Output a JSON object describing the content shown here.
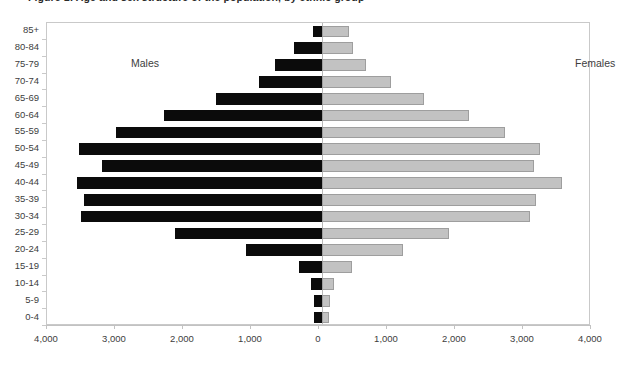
{
  "chart_data": {
    "type": "bar",
    "subtype": "population-pyramid",
    "title": "Figure 1: Age and sex structure of the population, by ethnic group",
    "xlabel": "",
    "ylabel": "",
    "xlim": [
      -4000,
      4000
    ],
    "xticks": [
      "4,000",
      "3,000",
      "2,000",
      "1,000",
      "0",
      "1,000",
      "2,000",
      "3,000",
      "4,000"
    ],
    "xtick_values": [
      -4000,
      -3000,
      -2000,
      -1000,
      0,
      1000,
      2000,
      3000,
      4000
    ],
    "grid": false,
    "legend_position": "in-plot",
    "categories": [
      "85+",
      "80-84",
      "75-79",
      "70-74",
      "65-69",
      "60-64",
      "55-59",
      "50-54",
      "45-49",
      "40-44",
      "35-39",
      "30-34",
      "25-29",
      "20-24",
      "15-19",
      "10-14",
      "5-9",
      "0-4"
    ],
    "series": [
      {
        "name": "Males",
        "color": "#0b0b0b",
        "direction": "left",
        "values": [
          130,
          420,
          700,
          940,
          1580,
          2360,
          3080,
          3630,
          3290,
          3660,
          3560,
          3600,
          2200,
          1140,
          340,
          160,
          110,
          110
        ]
      },
      {
        "name": "Females",
        "color": "#c2c2c2",
        "direction": "right",
        "values": [
          400,
          460,
          660,
          1040,
          1530,
          2210,
          2740,
          3270,
          3170,
          3590,
          3200,
          3120,
          1900,
          1210,
          450,
          180,
          120,
          110
        ]
      }
    ]
  },
  "labels": {
    "males": "Males",
    "females": "Females"
  }
}
